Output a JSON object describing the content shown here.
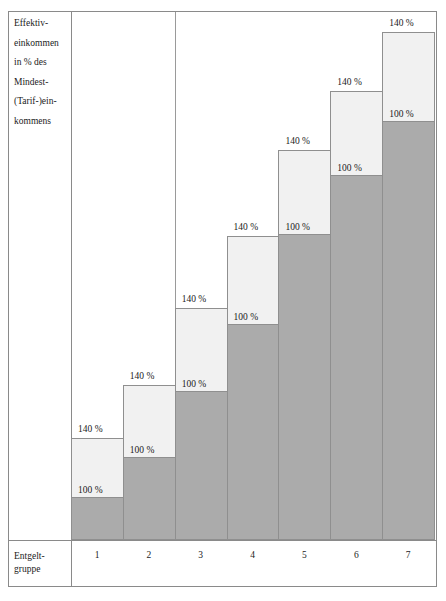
{
  "top_strip": {
    "text": "·················"
  },
  "axis_caption": {
    "lines": [
      "Effektiv-",
      "einkommen",
      "in % des",
      "Mindest-",
      "(Tarif-)ein-",
      "kommens"
    ]
  },
  "footer": {
    "label_lines": [
      "Entgelt-",
      "gruppe"
    ]
  },
  "colors": {
    "segment_upper": "#f1f1f1",
    "segment_lower": "#ababab",
    "outline": "#8f8f8f",
    "frame": "#8a8a8a",
    "text": "#1b1b1b"
  },
  "chart_data": {
    "type": "bar",
    "title": "",
    "subtitle": "",
    "xlabel": "Entgeltgruppe",
    "ylabel": "Effektiveinkommen in % des Mindest-(Tarif-)einkommens",
    "categories": [
      "1",
      "2",
      "3",
      "4",
      "5",
      "6",
      "7"
    ],
    "grid": false,
    "legend": false,
    "stacked": true,
    "series": [
      {
        "name": "100 %",
        "label": "100 %",
        "color": "#ababab",
        "values": [
          100,
          100,
          100,
          100,
          100,
          100,
          100
        ]
      },
      {
        "name": "140 %",
        "label": "140 %",
        "color": "#f1f1f1",
        "values": [
          40,
          40,
          40,
          40,
          40,
          40,
          40
        ]
      }
    ],
    "bars": [
      {
        "category": "1",
        "lower_label": "100 %",
        "upper_label": "140 %",
        "base_px": 540,
        "hundred_px": 498,
        "top_px": 438
      },
      {
        "category": "2",
        "lower_label": "100 %",
        "upper_label": "140 %",
        "base_px": 540,
        "hundred_px": 458,
        "top_px": 385
      },
      {
        "category": "3",
        "lower_label": "100 %",
        "upper_label": "140 %",
        "base_px": 540,
        "hundred_px": 392,
        "top_px": 308
      },
      {
        "category": "4",
        "lower_label": "100 %",
        "upper_label": "140 %",
        "base_px": 540,
        "hundred_px": 325,
        "top_px": 236
      },
      {
        "category": "5",
        "lower_label": "100 %",
        "upper_label": "140 %",
        "base_px": 540,
        "hundred_px": 235,
        "top_px": 150
      },
      {
        "category": "6",
        "lower_label": "100 %",
        "upper_label": "140 %",
        "base_px": 540,
        "hundred_px": 176,
        "top_px": 91
      },
      {
        "category": "7",
        "lower_label": "100 %",
        "upper_label": "140 %",
        "base_px": 540,
        "hundred_px": 122,
        "top_px": 32
      }
    ],
    "annotations": [
      {
        "text": "140 %",
        "bar": "1"
      },
      {
        "text": "100 %",
        "bar": "1"
      },
      {
        "text": "140 %",
        "bar": "2"
      },
      {
        "text": "100 %",
        "bar": "2"
      },
      {
        "text": "140 %",
        "bar": "3"
      },
      {
        "text": "100 %",
        "bar": "3"
      },
      {
        "text": "140 %",
        "bar": "4"
      },
      {
        "text": "100 %",
        "bar": "4"
      },
      {
        "text": "140 %",
        "bar": "5"
      },
      {
        "text": "100 %",
        "bar": "5"
      },
      {
        "text": "140 %",
        "bar": "6"
      },
      {
        "text": "100 %",
        "bar": "6"
      },
      {
        "text": "140 %",
        "bar": "7"
      },
      {
        "text": "100 %",
        "bar": "7"
      }
    ]
  }
}
